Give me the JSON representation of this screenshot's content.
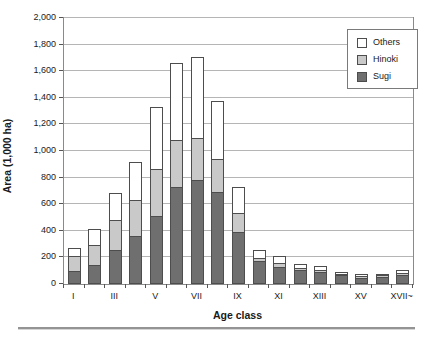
{
  "figure": {
    "background": "#ffffff",
    "outline_color": "#4d4d4d",
    "gridline_color": "#b5b5b5",
    "plot_border_color": "#8a8a8a"
  },
  "chart_data": {
    "type": "bar",
    "stacked": true,
    "title": "",
    "xlabel": "Age class",
    "ylabel": "Area (1,000 ha)",
    "ylim": [
      0,
      2000
    ],
    "ytick_interval": 200,
    "ytick_values": [
      0,
      200,
      400,
      600,
      800,
      1000,
      1200,
      1400,
      1600,
      1800,
      2000
    ],
    "ytick_labels": [
      "0",
      "200",
      "400",
      "600",
      "800",
      "1,000",
      "1,200",
      "1,400",
      "1,600",
      "1,800",
      "2,000"
    ],
    "grid": true,
    "categories": [
      "I",
      "II",
      "III",
      "IV",
      "V",
      "VI",
      "VII",
      "VIII",
      "IX",
      "X",
      "XI",
      "XII",
      "XIII",
      "XIV",
      "XV",
      "XVI",
      "XVII~"
    ],
    "xtick_labeled_indices": [
      0,
      2,
      4,
      6,
      8,
      10,
      12,
      14,
      16
    ],
    "xtick_shown_labels": [
      "I",
      "III",
      "V",
      "VII",
      "IX",
      "XI",
      "XIII",
      "XV",
      "XVII~"
    ],
    "series": [
      {
        "name": "Sugi",
        "color": "#6f6f6f",
        "values": [
          95,
          145,
          255,
          360,
          510,
          730,
          780,
          695,
          390,
          170,
          130,
          105,
          90,
          70,
          45,
          50,
          65
        ]
      },
      {
        "name": "Hinoki",
        "color": "#c9c9c9",
        "values": [
          120,
          155,
          235,
          280,
          360,
          360,
          320,
          255,
          150,
          30,
          35,
          25,
          25,
          15,
          20,
          20,
          20
        ]
      },
      {
        "name": "Others",
        "color": "#ffffff",
        "values": [
          65,
          130,
          210,
          290,
          470,
          590,
          620,
          445,
          200,
          70,
          60,
          40,
          40,
          25,
          20,
          5,
          30
        ]
      }
    ],
    "totals": [
      280,
      430,
      700,
      930,
      1340,
      1680,
      1720,
      1395,
      740,
      270,
      225,
      170,
      155,
      110,
      85,
      75,
      115
    ],
    "legend": {
      "position": "top-right",
      "entries": [
        "Others",
        "Hinoki",
        "Sugi"
      ]
    }
  }
}
